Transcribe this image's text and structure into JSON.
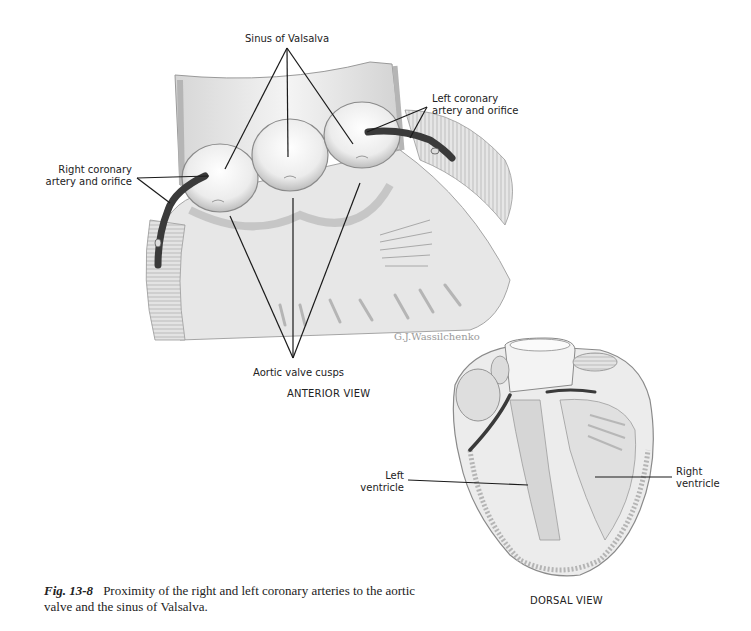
{
  "figure": {
    "number": "Fig. 13-8",
    "caption": "Proximity of the right and left coronary arteries to the aortic valve and the sinus of Valsalva."
  },
  "anterior_view": {
    "title": "ANTERIOR VIEW",
    "labels": {
      "sinus": "Sinus of Valsalva",
      "right_coronary_line1": "Right coronary",
      "right_coronary_line2": "artery and orifice",
      "left_coronary_line1": "Left coronary",
      "left_coronary_line2": "artery and orifice",
      "cusps": "Aortic valve cusps"
    },
    "signature": "G.J.Wassilchenko"
  },
  "dorsal_view": {
    "title": "DORSAL VIEW",
    "labels": {
      "left_ventricle_line1": "Left",
      "left_ventricle_line2": "ventricle",
      "right_ventricle_line1": "Right",
      "right_ventricle_line2": "ventricle"
    }
  },
  "colors": {
    "ink": "#1a1a1a",
    "artery": "#3a3a3a",
    "tissue_light": "#e9e9e9",
    "tissue_mid": "#c8c8c8",
    "signature": "#9a9a9a"
  }
}
